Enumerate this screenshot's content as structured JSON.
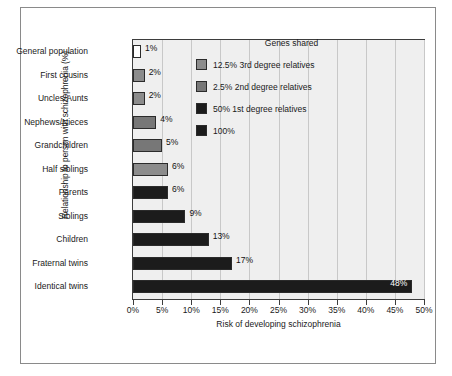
{
  "chart_data": {
    "type": "bar",
    "orientation": "horizontal",
    "title": "",
    "xlabel": "Risk of developing schizophrenia",
    "ylabel": "Relationship to person with schizophrenia (%)",
    "xlim": [
      0,
      50
    ],
    "xtick_labels": [
      "0%",
      "5%",
      "10%",
      "15%",
      "20%",
      "25%",
      "30%",
      "35%",
      "40%",
      "45%",
      "50%"
    ],
    "xtick_values": [
      0,
      5,
      10,
      15,
      20,
      25,
      30,
      35,
      40,
      45,
      50
    ],
    "grid": "vertical",
    "legend_position": "inside-upper-right",
    "categories": [
      "General population",
      "First cousins",
      "Uncles/Aunts",
      "Nephews/Nieces",
      "Grandchildren",
      "Half siblings",
      "Parents",
      "Siblings",
      "Children",
      "Fraternal twins",
      "Identical twins"
    ],
    "values": [
      1,
      2,
      2,
      4,
      5,
      6,
      6,
      9,
      13,
      17,
      48
    ],
    "value_labels": [
      "1%",
      "2%",
      "2%",
      "4%",
      "5%",
      "6%",
      "6%",
      "9%",
      "13%",
      "17%",
      "48%"
    ],
    "bar_groups": [
      "general",
      "third-degree",
      "third-degree",
      "second-degree",
      "second-degree",
      "second-degree",
      "first-degree",
      "first-degree",
      "first-degree",
      "first-degree",
      "identical"
    ],
    "bar_colors": [
      "#ffffff",
      "#8c8c8c",
      "#8c8c8c",
      "#777777",
      "#777777",
      "#8c8c8c",
      "#1c1c1c",
      "#1c1c1c",
      "#1c1c1c",
      "#1c1c1c",
      "#1c1c1c"
    ],
    "label_inside": [
      false,
      false,
      false,
      false,
      false,
      false,
      false,
      false,
      false,
      false,
      true
    ],
    "plot_background": "#efefef",
    "gridline_color": "#c8c8c8",
    "axis_color": "#3d3d3d"
  },
  "legend": {
    "title": "Genes shared",
    "items": [
      {
        "label": "12.5% 3rd degree relatives",
        "color": "#8c8c8c"
      },
      {
        "label": "2.5% 2nd degree relatives",
        "color": "#777777"
      },
      {
        "label": "50% 1st degree relatives",
        "color": "#1c1c1c"
      },
      {
        "label": "100%",
        "color": "#1c1c1c"
      }
    ]
  }
}
